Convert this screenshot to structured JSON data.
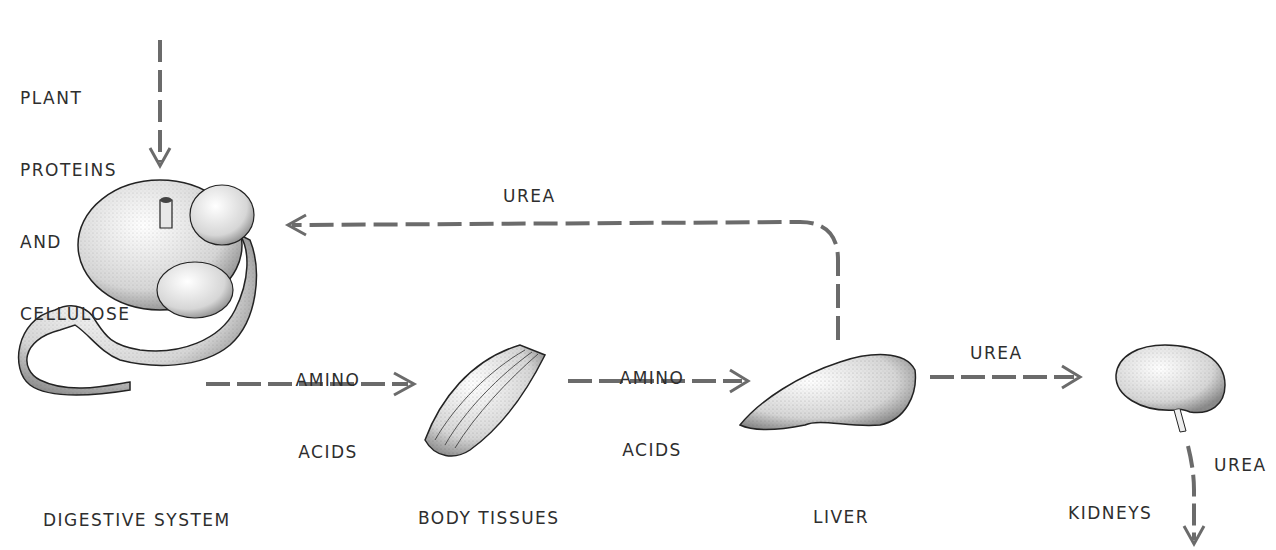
{
  "diagram": {
    "input_label": [
      "PLANT",
      "PROTEINS",
      "AND",
      "CELLULOSE"
    ],
    "organs": {
      "digestive": "DIGESTIVE SYSTEM",
      "tissues": "BODY TISSUES",
      "liver": "LIVER",
      "kidneys": "KIDNEYS"
    },
    "flows": {
      "amino_1": [
        "AMINO",
        "ACIDS"
      ],
      "amino_2": [
        "AMINO",
        "ACIDS"
      ],
      "urea_recycle": "UREA",
      "urea_to_kidney": "UREA",
      "urea_out": "UREA"
    },
    "colors": {
      "arrow": "#6b6b6b",
      "ink": "#2e2e2e",
      "organ_fill": "#f2f2f2",
      "organ_stroke": "#222222"
    }
  }
}
